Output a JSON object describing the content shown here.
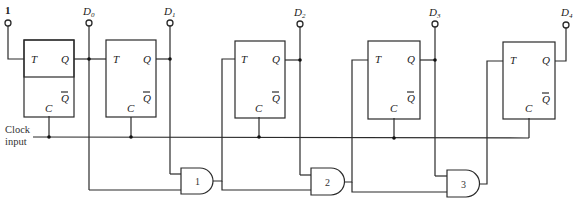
{
  "diagram": {
    "input_one_label": "1",
    "clock_label_line1": "Clock",
    "clock_label_line2": "input",
    "flipflops": [
      {
        "id": "FF0",
        "pin_t": "T",
        "pin_q": "Q",
        "pin_qbar": "Q",
        "pin_c": "C"
      },
      {
        "id": "FF1",
        "pin_t": "T",
        "pin_q": "Q",
        "pin_qbar": "Q",
        "pin_c": "C"
      },
      {
        "id": "FF2",
        "pin_t": "T",
        "pin_q": "Q",
        "pin_qbar": "Q",
        "pin_c": "C"
      },
      {
        "id": "FF3",
        "pin_t": "T",
        "pin_q": "Q",
        "pin_qbar": "Q",
        "pin_c": "C"
      },
      {
        "id": "FF4",
        "pin_t": "T",
        "pin_q": "Q",
        "pin_qbar": "Q",
        "pin_c": "C"
      }
    ],
    "outputs": [
      {
        "main": "D",
        "sub": "0"
      },
      {
        "main": "D",
        "sub": "1"
      },
      {
        "main": "D",
        "sub": "2"
      },
      {
        "main": "D",
        "sub": "3"
      },
      {
        "main": "D",
        "sub": "4"
      }
    ],
    "and_gates": [
      {
        "label": "1"
      },
      {
        "label": "2"
      },
      {
        "label": "3"
      }
    ]
  }
}
